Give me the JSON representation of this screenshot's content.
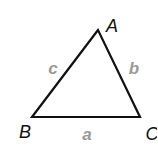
{
  "diagram": {
    "type": "triangle",
    "stroke_color": "#111111",
    "stroke_width": 2.2,
    "vertex_label_color": "#111111",
    "side_label_color": "#9a9a9a",
    "vertices": [
      {
        "id": "A",
        "label": "A",
        "x": 98,
        "y": 30,
        "label_x": 112,
        "label_y": 32
      },
      {
        "id": "B",
        "label": "B",
        "x": 32,
        "y": 117,
        "label_x": 25,
        "label_y": 138
      },
      {
        "id": "C",
        "label": "C",
        "x": 140,
        "y": 117,
        "label_x": 152,
        "label_y": 140
      }
    ],
    "sides": [
      {
        "id": "a",
        "label": "a",
        "from": "B",
        "to": "C",
        "label_x": 87,
        "label_y": 140
      },
      {
        "id": "b",
        "label": "b",
        "from": "C",
        "to": "A",
        "label_x": 134,
        "label_y": 74
      },
      {
        "id": "c",
        "label": "c",
        "from": "A",
        "to": "B",
        "label_x": 53,
        "label_y": 74
      }
    ]
  }
}
